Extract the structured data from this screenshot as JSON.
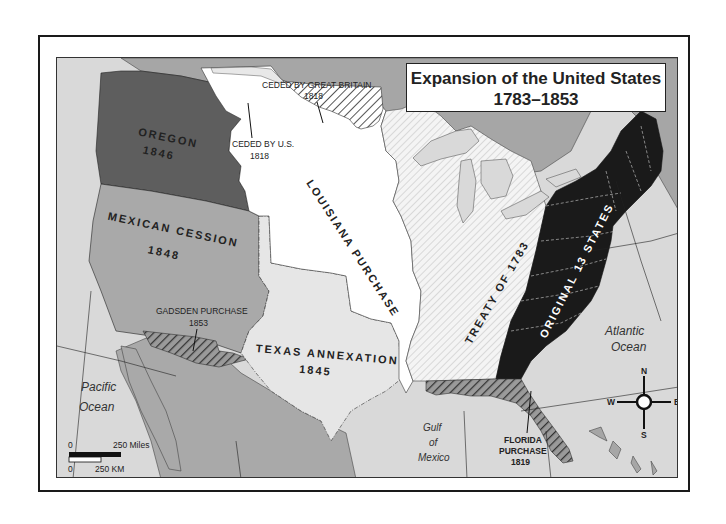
{
  "title": {
    "line1": "Expansion of the United States",
    "line2": "1783–1853"
  },
  "regions": [
    {
      "id": "original-13",
      "name": "ORIGINAL 13 STATES",
      "year": "",
      "color": "#1a1a1a"
    },
    {
      "id": "treaty-1783",
      "name": "TREATY OF 1783",
      "year": "",
      "pattern": "light-hatch"
    },
    {
      "id": "louisiana",
      "name": "LOUISIANA PURCHASE",
      "year": "",
      "color": "#ffffff"
    },
    {
      "id": "ceded-gb",
      "name": "CEDED BY GREAT BRITAIN",
      "year": "1818",
      "pattern": "dark-hatch"
    },
    {
      "id": "ceded-us",
      "name": "CEDED BY U.S.",
      "year": "1818",
      "color": "#e8e8e8"
    },
    {
      "id": "florida",
      "name": "FLORIDA PURCHASE",
      "year": "1819",
      "pattern": "dark-hatch"
    },
    {
      "id": "texas",
      "name": "TEXAS ANNEXATION",
      "year": "1845",
      "color": "#e6e6e6"
    },
    {
      "id": "oregon",
      "name": "OREGON",
      "year": "1846",
      "color": "#5e5e5e"
    },
    {
      "id": "mexican-cession",
      "name": "MEXICAN CESSION",
      "year": "1848",
      "color": "#a9a9a9"
    },
    {
      "id": "gadsden",
      "name": "GADSDEN PURCHASE",
      "year": "1853",
      "pattern": "dark-hatch"
    }
  ],
  "labels": {
    "oregon": "OREGON",
    "oregon_year": "1846",
    "mexican": "MEXICAN CESSION",
    "mexican_year": "1848",
    "gadsden": "GADSDEN PURCHASE",
    "gadsden_year": "1853",
    "louisiana": "LOUISIANA PURCHASE",
    "texas": "TEXAS ANNEXATION",
    "texas_year": "1845",
    "treaty": "TREATY OF 1783",
    "original": "ORIGINAL 13 STATES",
    "ceded_gb": "CEDED BY GREAT BRITAIN",
    "ceded_gb_year": "1818",
    "ceded_us": "CEDED BY U.S.",
    "ceded_us_year": "1818",
    "florida1": "FLORIDA",
    "florida2": "PURCHASE",
    "florida_year": "1819"
  },
  "oceans": {
    "pacific1": "Pacific",
    "pacific2": "Ocean",
    "atlantic1": "Atlantic",
    "atlantic2": "Ocean",
    "gulf1": "Gulf",
    "gulf2": "of",
    "gulf3": "Mexico"
  },
  "compass": {
    "n": "N",
    "s": "S",
    "e": "E",
    "w": "W"
  },
  "scale": {
    "miles_zero": "0",
    "miles_label": "250 Miles",
    "km_zero": "0",
    "km_label": "250 KM"
  },
  "colors": {
    "water": "#d9d9d9",
    "foreign_land": "#a6a6a6",
    "original13": "#1a1a1a",
    "oregon": "#5e5e5e",
    "mexican_cession": "#a9a9a9",
    "texas": "#e6e6e6",
    "louisiana": "#ffffff"
  }
}
